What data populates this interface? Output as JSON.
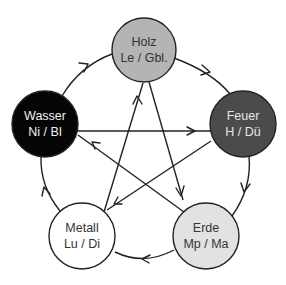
{
  "diagram": {
    "nodes": [
      {
        "id": "holz",
        "label": "Holz",
        "sub": "Le / Gbl.",
        "fill": "#b4b4b4",
        "text_color": "#333333",
        "cx": 144,
        "cy": 50,
        "r": 32
      },
      {
        "id": "feuer",
        "label": "Feuer",
        "sub": "H / Dü",
        "fill": "#4b4b4b",
        "text_color": "#e6e6e6",
        "cx": 243,
        "cy": 124,
        "r": 33
      },
      {
        "id": "erde",
        "label": "Erde",
        "sub": "Mp / Ma",
        "fill": "#e2e2e2",
        "text_color": "#333333",
        "cx": 206,
        "cy": 236,
        "r": 33
      },
      {
        "id": "metall",
        "label": "Metall",
        "sub": "Lu / Di",
        "fill": "#ffffff",
        "text_color": "#333333",
        "cx": 82,
        "cy": 236,
        "r": 33
      },
      {
        "id": "wasser",
        "label": "Wasser",
        "sub": "Ni / Bl",
        "fill": "#050505",
        "text_color": "#f2f2f2",
        "cx": 45,
        "cy": 124,
        "r": 33
      }
    ],
    "generating_cycle": [
      {
        "from": "holz",
        "to": "feuer"
      },
      {
        "from": "feuer",
        "to": "erde"
      },
      {
        "from": "erde",
        "to": "metall"
      },
      {
        "from": "metall",
        "to": "wasser"
      },
      {
        "from": "wasser",
        "to": "holz"
      }
    ],
    "controlling_cycle": [
      {
        "from": "holz",
        "to": "erde"
      },
      {
        "from": "erde",
        "to": "wasser"
      },
      {
        "from": "wasser",
        "to": "feuer"
      },
      {
        "from": "feuer",
        "to": "metall"
      },
      {
        "from": "metall",
        "to": "holz"
      }
    ]
  }
}
